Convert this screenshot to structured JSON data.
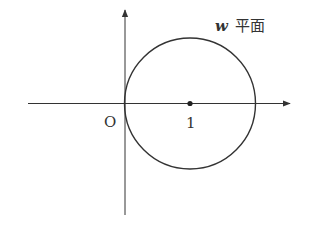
{
  "diagram": {
    "plane_label_var": "w",
    "plane_label_text": "平面",
    "origin_label": "O",
    "center_label": "1",
    "colors": {
      "stroke": "#333333",
      "background": "#ffffff"
    },
    "circle": {
      "center": [
        1,
        0
      ],
      "radius": 1
    }
  }
}
